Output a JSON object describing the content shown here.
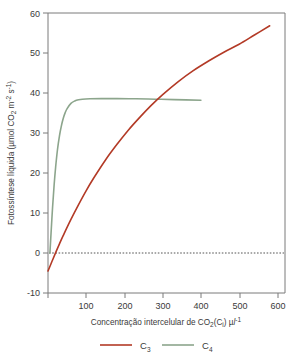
{
  "figure": {
    "background": "#ffffff",
    "frame_color": "#7b7b7b"
  },
  "chart_data": {
    "type": "line",
    "title": "",
    "xlabel": "Concentração intercelular de CO2(Ci) µl-1",
    "xlabel_parts": {
      "a": "Concentração intercelular de CO",
      "sub1": "2",
      "b": "(C",
      "sub2": "i",
      "c": ") µ",
      "italic": "l",
      "sup1": "-1"
    },
    "ylabel": "Fotossíntese líquida (µmol CO2 m-2 s-1)",
    "ylabel_parts": {
      "a": "Fotossíntese líquida (µmol CO",
      "sub1": "2",
      "b": " m",
      "sup1": "-2",
      "c": " s",
      "sup2": "-1",
      "d": ")"
    },
    "xlim": [
      0,
      620
    ],
    "ylim": [
      -10,
      60
    ],
    "xticks": [
      0,
      100,
      200,
      300,
      400,
      500,
      600
    ],
    "xticklabels": [
      "",
      "100",
      "200",
      "300",
      "400",
      "500",
      "600"
    ],
    "yticks": [
      -10,
      0,
      10,
      20,
      30,
      40,
      50,
      60
    ],
    "yticklabels": [
      "-10",
      "0",
      "10",
      "20",
      "30",
      "40",
      "50",
      "60"
    ],
    "grid": false,
    "zero_reference_line": {
      "y": 0,
      "style": "dotted",
      "color": "#555555"
    },
    "legend_position": "below",
    "series": [
      {
        "name": "C3",
        "name_base": "C",
        "name_sub": "3",
        "color": "#b33a26",
        "x": [
          0,
          10,
          20,
          30,
          40,
          60,
          80,
          100,
          120,
          150,
          180,
          210,
          240,
          270,
          300,
          340,
          380,
          420,
          460,
          500,
          540,
          580
        ],
        "y": [
          -4.5,
          -2.2,
          0.1,
          2.3,
          4.4,
          8.4,
          12.1,
          15.6,
          18.8,
          23.2,
          27.1,
          30.7,
          33.9,
          36.9,
          39.6,
          42.8,
          45.6,
          48.0,
          50.2,
          52.2,
          54.5,
          56.8
        ]
      },
      {
        "name": "C4",
        "name_base": "C",
        "name_sub": "4",
        "color": "#8ca58c",
        "x": [
          5,
          8,
          12,
          16,
          20,
          25,
          30,
          35,
          40,
          45,
          50,
          60,
          70,
          80,
          90,
          110,
          140,
          180,
          230,
          280,
          330,
          400
        ],
        "y": [
          0.0,
          5.0,
          11.5,
          17.0,
          21.5,
          26.0,
          29.3,
          31.8,
          33.7,
          35.1,
          36.1,
          37.4,
          38.0,
          38.3,
          38.45,
          38.55,
          38.6,
          38.6,
          38.55,
          38.45,
          38.35,
          38.2
        ]
      }
    ]
  },
  "legend": {
    "items": [
      {
        "label_base": "C",
        "label_sub": "3",
        "color": "#b33a26"
      },
      {
        "label_base": "C",
        "label_sub": "4",
        "color": "#8ca58c"
      }
    ]
  }
}
